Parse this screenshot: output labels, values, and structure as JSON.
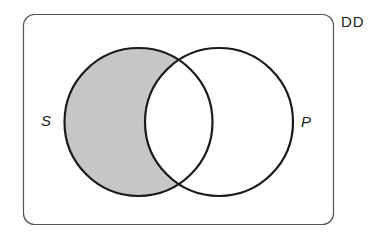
{
  "diagram": {
    "type": "venn",
    "universe": {
      "label": "DD"
    },
    "sets": [
      {
        "id": "S",
        "label": "S"
      },
      {
        "id": "P",
        "label": "P"
      }
    ],
    "shaded_regions": [
      "S only (S and not P)"
    ],
    "colors": {
      "outline": "#1a1a1a",
      "shade": "#c6c6c6",
      "frame": "#555555",
      "background": "#ffffff"
    }
  }
}
